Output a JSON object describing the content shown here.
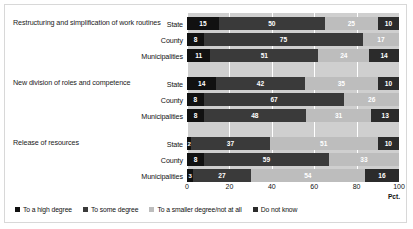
{
  "chart_data": {
    "type": "bar",
    "orientation": "horizontal",
    "stacked": true,
    "title": "",
    "xlabel": "Pct.",
    "ylabel": "",
    "xlim": [
      0,
      100
    ],
    "xticks": [
      "0",
      "20",
      "40",
      "60",
      "80",
      "100"
    ],
    "grid": true,
    "legend_position": "bottom",
    "legend": [
      {
        "label": "To a high degree",
        "color": "#111111"
      },
      {
        "label": "To some degree",
        "color": "#3a3a3a"
      },
      {
        "label": "To a smaller degree/not at all",
        "color": "#bdbdbd"
      },
      {
        "label": "Do not know",
        "color": "#2b2b2b"
      }
    ],
    "series": [
      {
        "name": "To a high degree"
      },
      {
        "name": "To some degree"
      },
      {
        "name": "To a smaller degree/not at all"
      },
      {
        "name": "Do not know"
      }
    ],
    "groups": [
      {
        "label": "Restructuring and simplification of work routines",
        "rows": [
          {
            "category": "State",
            "values": [
              15,
              50,
              25,
              10
            ]
          },
          {
            "category": "County",
            "values": [
              8,
              75,
              17,
              0
            ]
          },
          {
            "category": "Municipalities",
            "values": [
              11,
              51,
              24,
              14
            ]
          }
        ]
      },
      {
        "label": "New division of roles and competence",
        "rows": [
          {
            "category": "State",
            "values": [
              14,
              42,
              35,
              10
            ]
          },
          {
            "category": "County",
            "values": [
              8,
              67,
              26,
              0
            ]
          },
          {
            "category": "Municipalities",
            "values": [
              8,
              48,
              31,
              13
            ]
          }
        ]
      },
      {
        "label": "Release of resources",
        "rows": [
          {
            "category": "State",
            "values": [
              2,
              37,
              51,
              10
            ]
          },
          {
            "category": "County",
            "values": [
              8,
              59,
              33,
              0
            ]
          },
          {
            "category": "Municipalities",
            "values": [
              3,
              27,
              54,
              16
            ]
          }
        ]
      }
    ]
  }
}
